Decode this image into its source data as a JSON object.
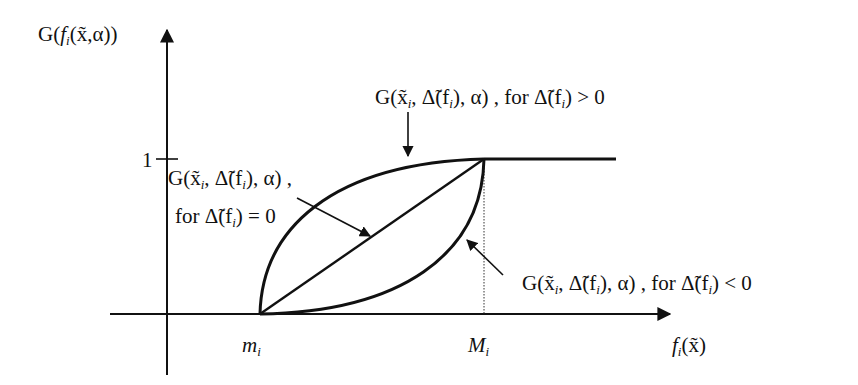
{
  "figure": {
    "y_axis_label": "G(f_i(x̃, α))",
    "x_axis_label": "f_i(x̃)",
    "y_tick_one": "1",
    "x_tick_min": "m_i",
    "x_tick_max": "M_i",
    "curve_upper_label": "G(x̃_i, Δ̃(f_i), α) , for  Δ̃(f_i) > 0",
    "curve_linear_label_line1": "G(x̃_i, Δ̃(f_i), α) ,",
    "curve_linear_label_line2": "for Δ̃(f_i) = 0",
    "curve_lower_label": "G(x̃_i, Δ̃(f_i), α) , for  Δ̃(f_i) < 0"
  },
  "labels": {
    "y_axis": {
      "G": "G(",
      "f": "f",
      "i": "i",
      "rest": "(x̃,α))"
    },
    "x_axis": {
      "f": "f",
      "i": "i",
      "rest": "(x̃)"
    },
    "tick_one": "1",
    "m": "m",
    "m_sub": "i",
    "M": "M",
    "M_sub": "i",
    "upper": {
      "pre": "G(x̃",
      "sub1": "i",
      "mid": ", Δ̃(f",
      "sub2": "i",
      "post": "), α) , for  Δ̃(f",
      "sub3": "i",
      "end": ") > 0"
    },
    "linear1": {
      "pre": "G(x̃",
      "sub1": "i",
      "mid": ", Δ̃(f",
      "sub2": "i",
      "post": "), α) ,"
    },
    "linear2": {
      "pre": "for Δ̃(f",
      "sub": "i",
      "post": ") = 0"
    },
    "lower": {
      "pre": "G(x̃",
      "sub1": "i",
      "mid": ", Δ̃(f",
      "sub2": "i",
      "post": "), α) , for  Δ̃(f",
      "sub3": "i",
      "end": ") < 0"
    }
  },
  "colors": {
    "ink": "#111111",
    "background": "#ffffff"
  }
}
